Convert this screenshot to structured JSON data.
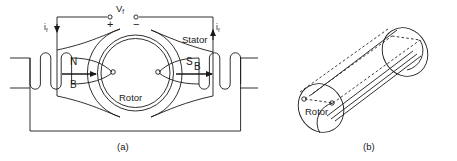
{
  "figure": {
    "title_a": "(a)",
    "title_b": "(b)",
    "stroke_color": "#1a1a1a",
    "text_color": "#1a1a1a",
    "background": "#ffffff"
  },
  "panel_a": {
    "caption": "(a)",
    "voltage_label": "V",
    "voltage_subscript": "f",
    "terminal_plus": "+",
    "terminal_minus": "−",
    "current_left_label": "i",
    "current_left_subscript": "f",
    "current_right_label": "i",
    "current_right_subscript": "f",
    "pole_north": "N",
    "pole_south": "S",
    "field_left": "B",
    "field_right": "B",
    "stator_label": "Stator",
    "rotor_label": "Rotor"
  },
  "panel_b": {
    "caption": "(b)",
    "rotor_label": "Rotor"
  }
}
